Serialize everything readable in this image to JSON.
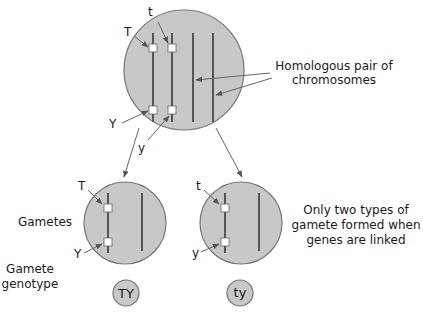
{
  "diagram": {
    "parent_cell": {
      "alleles_chromosome1": [
        "T",
        "Y"
      ],
      "alleles_chromosome2": [
        "t",
        "y"
      ],
      "annotation": [
        "Homologous pair of",
        "chromosomes"
      ]
    },
    "labels": {
      "gametes": "Gametes",
      "gamete_genotype": [
        "Gamete",
        "genotype"
      ],
      "note": [
        "Only two types of",
        "gamete formed when",
        "genes are linked"
      ]
    },
    "gametes": [
      {
        "alleles": [
          "T",
          "Y"
        ],
        "genotype": "TY"
      },
      {
        "alleles": [
          "t",
          "y"
        ],
        "genotype": "ty"
      }
    ],
    "colors": {
      "cell_fill": "#c8c8c8",
      "cell_stroke": "#777777",
      "chromosome": "#555555",
      "gene_locus": "#ffffff",
      "arrow": "#666666",
      "text": "#1a1a1a"
    }
  }
}
